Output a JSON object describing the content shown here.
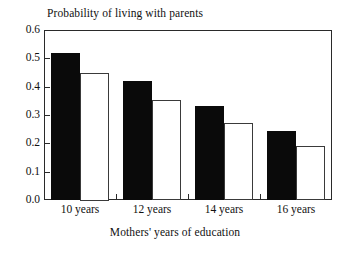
{
  "chart_data": {
    "type": "bar",
    "title": "Probability of living with parents",
    "subtitle": "",
    "xlabel": "Mothers' years of education",
    "ylabel": "Probability of living with parents",
    "categories": [
      "10 years",
      "12 years",
      "14 years",
      "16 years"
    ],
    "series": [
      {
        "name": "black-bar",
        "fill": "#0a0a0a",
        "values": [
          0.52,
          0.42,
          0.333,
          0.243
        ]
      },
      {
        "name": "white-bar",
        "fill": "#ffffff",
        "values": [
          0.45,
          0.352,
          0.272,
          0.19
        ]
      }
    ],
    "ylim": [
      0.0,
      0.6
    ],
    "ytick_labels": [
      "0.6",
      "0.5",
      "0.4",
      "0.3",
      "0.2",
      "0.1",
      "0.0"
    ],
    "ytick_values": [
      0.6,
      0.5,
      0.4,
      0.3,
      0.2,
      0.1,
      0.0
    ],
    "grid": false,
    "legend": "none",
    "frame_color": "#2a2a2a"
  }
}
